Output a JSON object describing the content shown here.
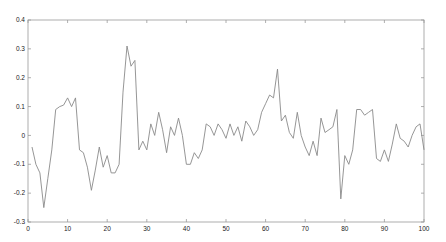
{
  "chart_data": {
    "type": "line",
    "title": "",
    "xlabel": "",
    "ylabel": "",
    "xlim": [
      0,
      100
    ],
    "ylim": [
      -0.3,
      0.4
    ],
    "grid": false,
    "legend": null,
    "xticks": [
      0,
      10,
      20,
      30,
      40,
      50,
      60,
      70,
      80,
      90,
      100
    ],
    "yticks": [
      -0.3,
      -0.2,
      -0.1,
      0,
      0.1,
      0.2,
      0.3,
      0.4
    ],
    "xtick_labels": [
      "0",
      "10",
      "20",
      "30",
      "40",
      "50",
      "60",
      "70",
      "80",
      "90",
      "100"
    ],
    "ytick_labels": [
      "-0.3",
      "-0.2",
      "-0.1",
      "0",
      "0.1",
      "0.2",
      "0.3",
      "0.4"
    ],
    "series": [
      {
        "name": "signal",
        "color": "#8a8a8a",
        "x": [
          1,
          2,
          3,
          4,
          5,
          6,
          7,
          8,
          9,
          10,
          11,
          12,
          13,
          14,
          15,
          16,
          17,
          18,
          19,
          20,
          21,
          22,
          23,
          24,
          25,
          26,
          27,
          28,
          29,
          30,
          31,
          32,
          33,
          34,
          35,
          36,
          37,
          38,
          39,
          40,
          41,
          42,
          43,
          44,
          45,
          46,
          47,
          48,
          49,
          50,
          51,
          52,
          53,
          54,
          55,
          56,
          57,
          58,
          59,
          60,
          61,
          62,
          63,
          64,
          65,
          66,
          67,
          68,
          69,
          70,
          71,
          72,
          73,
          74,
          75,
          76,
          77,
          78,
          79,
          80,
          81,
          82,
          83,
          84,
          85,
          86,
          87,
          88,
          89,
          90,
          91,
          92,
          93,
          94,
          95,
          96,
          97,
          98,
          99,
          100
        ],
        "values": [
          -0.04,
          -0.1,
          -0.13,
          -0.25,
          -0.15,
          -0.05,
          0.09,
          0.1,
          0.105,
          0.13,
          0.1,
          0.13,
          -0.05,
          -0.06,
          -0.11,
          -0.19,
          -0.12,
          -0.04,
          -0.11,
          -0.07,
          -0.13,
          -0.13,
          -0.1,
          0.15,
          0.31,
          0.24,
          0.26,
          -0.05,
          -0.02,
          -0.05,
          0.04,
          0.0,
          0.08,
          0.02,
          -0.06,
          0.03,
          0.0,
          0.06,
          0.0,
          -0.1,
          -0.1,
          -0.06,
          -0.08,
          -0.05,
          0.04,
          0.03,
          0.0,
          0.04,
          0.02,
          -0.01,
          0.04,
          0.0,
          0.03,
          -0.02,
          0.05,
          0.03,
          0.0,
          0.02,
          0.08,
          0.11,
          0.14,
          0.13,
          0.23,
          0.05,
          0.07,
          0.01,
          -0.01,
          0.08,
          0.0,
          -0.04,
          -0.07,
          -0.02,
          -0.07,
          0.06,
          0.01,
          0.02,
          0.03,
          0.09,
          -0.22,
          -0.07,
          -0.1,
          -0.05,
          0.09,
          0.09,
          0.07,
          0.08,
          0.09,
          -0.08,
          -0.09,
          -0.05,
          -0.09,
          -0.03,
          0.04,
          -0.01,
          -0.02,
          -0.04,
          0.0,
          0.03,
          0.04,
          -0.05
        ]
      }
    ]
  }
}
